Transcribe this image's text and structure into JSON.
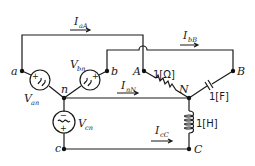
{
  "diagram": {
    "type": "three-phase circuit",
    "colors": {
      "line": "#1a1a1a",
      "node": "#111111",
      "background": "#ffffff"
    },
    "source_nodes": {
      "a": "a",
      "b": "b",
      "c": "c",
      "n": "n"
    },
    "load_nodes": {
      "A": "A",
      "B": "B",
      "C": "C",
      "N": "N"
    },
    "sources": [
      {
        "name": "V",
        "sub": "an",
        "symbol": "ac-source-icon"
      },
      {
        "name": "V",
        "sub": "bn",
        "symbol": "ac-source-icon"
      },
      {
        "name": "V",
        "sub": "cn",
        "symbol": "ac-source-icon"
      }
    ],
    "currents": [
      {
        "name": "I",
        "sub": "aA"
      },
      {
        "name": "I",
        "sub": "bB"
      },
      {
        "name": "I",
        "sub": "nN"
      },
      {
        "name": "I",
        "sub": "cC"
      }
    ],
    "components": {
      "resistor": "1[Ω]",
      "capacitor": "1[F]",
      "inductor": "1[H]"
    },
    "polarity": {
      "plus": "+",
      "minus": "−"
    }
  }
}
